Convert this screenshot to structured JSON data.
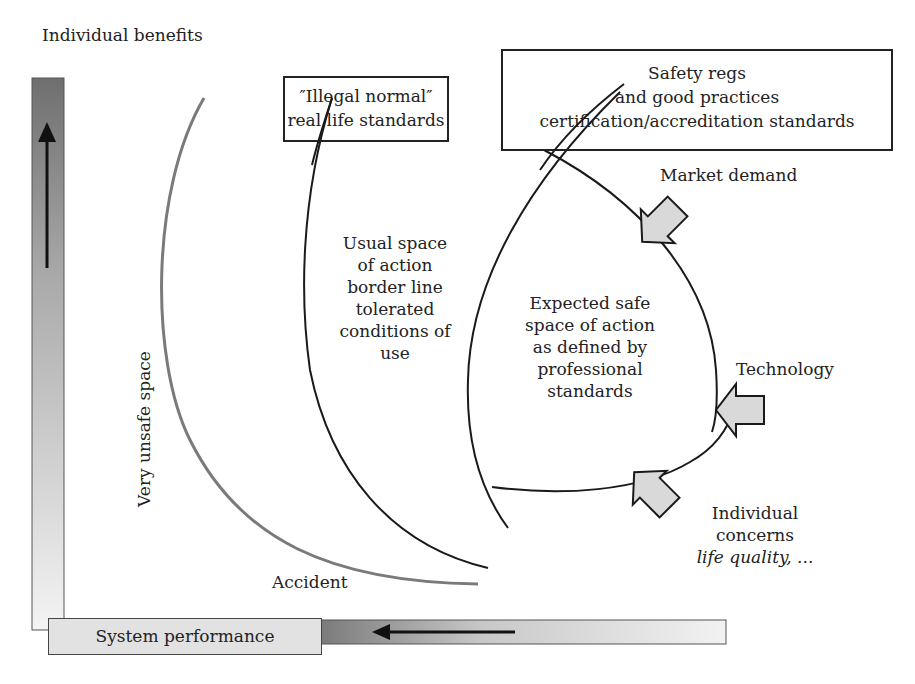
{
  "axes": {
    "y_label": "Individual benefits",
    "x_label": "System performance",
    "y_arrow_direction": "up",
    "x_arrow_direction": "left"
  },
  "boxes": {
    "illegal_normal": {
      "line1": "″Illegal normal″",
      "line2": "real life standards"
    },
    "safety_regs": {
      "line1": "Safety regs",
      "line2": "and good practices",
      "line3": "certification/accreditation standards"
    }
  },
  "regions": {
    "usual_space": [
      "Usual space",
      "of action",
      "border line",
      "tolerated",
      "conditions of",
      "use"
    ],
    "expected_safe": [
      "Expected safe",
      "space of action",
      "as defined by",
      "professional",
      "standards"
    ],
    "very_unsafe": "Very unsafe space",
    "accident": "Accident"
  },
  "pressures": {
    "market_demand": "Market demand",
    "technology": "Technology",
    "individual_concerns": {
      "line1": "Individual",
      "line2": "concerns",
      "line3": "life quality, ..."
    }
  },
  "colors": {
    "curve_dark": "#1a1a1a",
    "curve_gray": "#7a7a7a",
    "arrow_fill": "#d9d9d9",
    "axis_gradient_dark": "#6f6f6f",
    "axis_gradient_light": "#f4f4f4"
  }
}
